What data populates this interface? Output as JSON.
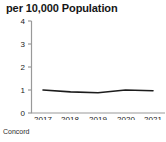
{
  "chart_data": {
    "type": "line",
    "title": "per 10,000 Population",
    "xlabel": "",
    "ylabel": "",
    "categories": [
      "2017",
      "2018",
      "2019",
      "2020",
      "2021"
    ],
    "x": [
      2017,
      2018,
      2019,
      2020,
      2021
    ],
    "series": [
      {
        "name": "Concord",
        "values": [
          1.0,
          0.92,
          0.88,
          1.0,
          0.97
        ]
      }
    ],
    "values": [
      1.0,
      0.92,
      0.88,
      1.0,
      0.97
    ],
    "ylim": [
      0,
      4
    ],
    "yticks": [
      "0",
      "1",
      "2",
      "3",
      "4"
    ],
    "ytick_values": [
      0,
      1,
      2,
      3,
      4
    ],
    "xticks": [
      "2017",
      "2018",
      "2019",
      "2020",
      "2021"
    ],
    "grid": false,
    "legend": false,
    "legend_position": "none",
    "line_color": "#1c1c1c",
    "axis_color": "#999999",
    "annotations": [
      "Concord"
    ]
  },
  "caption": {
    "label": "Concord"
  },
  "axis": {
    "y_ticks": [
      "4",
      "3",
      "2",
      "1",
      "0"
    ],
    "x_ticks": [
      "2017",
      "2018",
      "2019",
      "2020",
      "2021"
    ]
  },
  "colors": {
    "line": "#1c1c1c",
    "axis": "#999999",
    "text": "#1a1a1a",
    "background": "#ffffff"
  }
}
